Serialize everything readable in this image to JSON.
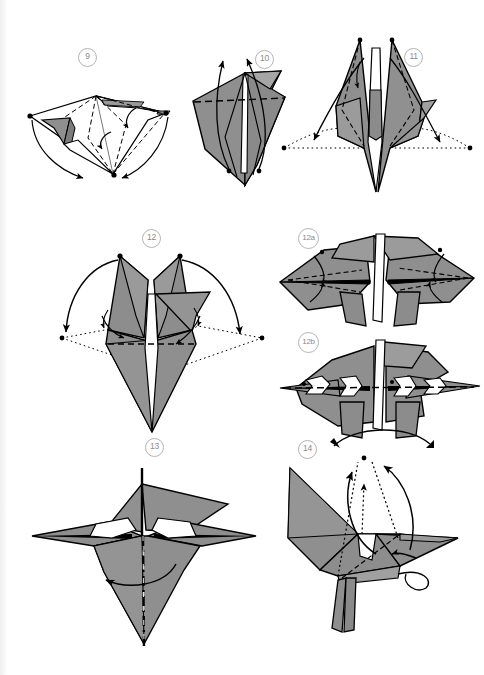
{
  "page": {
    "background_color": "#ffffff",
    "paper_fill_color": "#8f8f8f",
    "paper_fill_light": "#bdbdbd",
    "line_color": "#000000",
    "badge_text_color": "#8a8a8a",
    "badge_border_color": "#b4b4b4",
    "width": 484,
    "height": 675
  },
  "steps": [
    {
      "id": "step-9",
      "label": "9",
      "badge_x": 78,
      "badge_y": 48,
      "caption": "Flattened base seen from above with valley folds; fold points down to the bottom tip."
    },
    {
      "id": "step-10",
      "label": "10",
      "badge_x": 255,
      "badge_y": 50,
      "caption": "Kite form with horizontal valley fold; lift the two inner points upward."
    },
    {
      "id": "step-11",
      "label": "11",
      "badge_x": 404,
      "badge_y": 48,
      "caption": "Symmetric diamond with two raised spikes; swing the side flaps out to the dotted points."
    },
    {
      "id": "step-12",
      "label": "12",
      "badge_x": 142,
      "badge_y": 229,
      "caption": "Two horns raised; swing both wings outward and down along the dotted guides."
    },
    {
      "id": "step-12a",
      "label": "12a",
      "badge_x": 298,
      "badge_y": 228,
      "caption": "Detail: wings spread wide horizontally, reverse-fold the marked points."
    },
    {
      "id": "step-12b",
      "label": "12b",
      "badge_x": 298,
      "badge_y": 332,
      "caption": "Detail: points narrowed to slender spikes along the horizontal centre line."
    },
    {
      "id": "step-13",
      "label": "13",
      "badge_x": 145,
      "badge_y": 438,
      "caption": "Wings spread; mountain-fold the model in half along the vertical centre line."
    },
    {
      "id": "step-14",
      "label": "14",
      "badge_x": 298,
      "badge_y": 440,
      "caption": "Three-dimensional bird with legs; raise the head and neck points as shown."
    }
  ],
  "legend": {
    "valley_fold": "dashed line",
    "guide_line": "dotted line",
    "mountain_fold": "dash-dot line",
    "motion_arrow": "curved solid arrow",
    "hidden_motion_arrow": "dotted arrow"
  }
}
